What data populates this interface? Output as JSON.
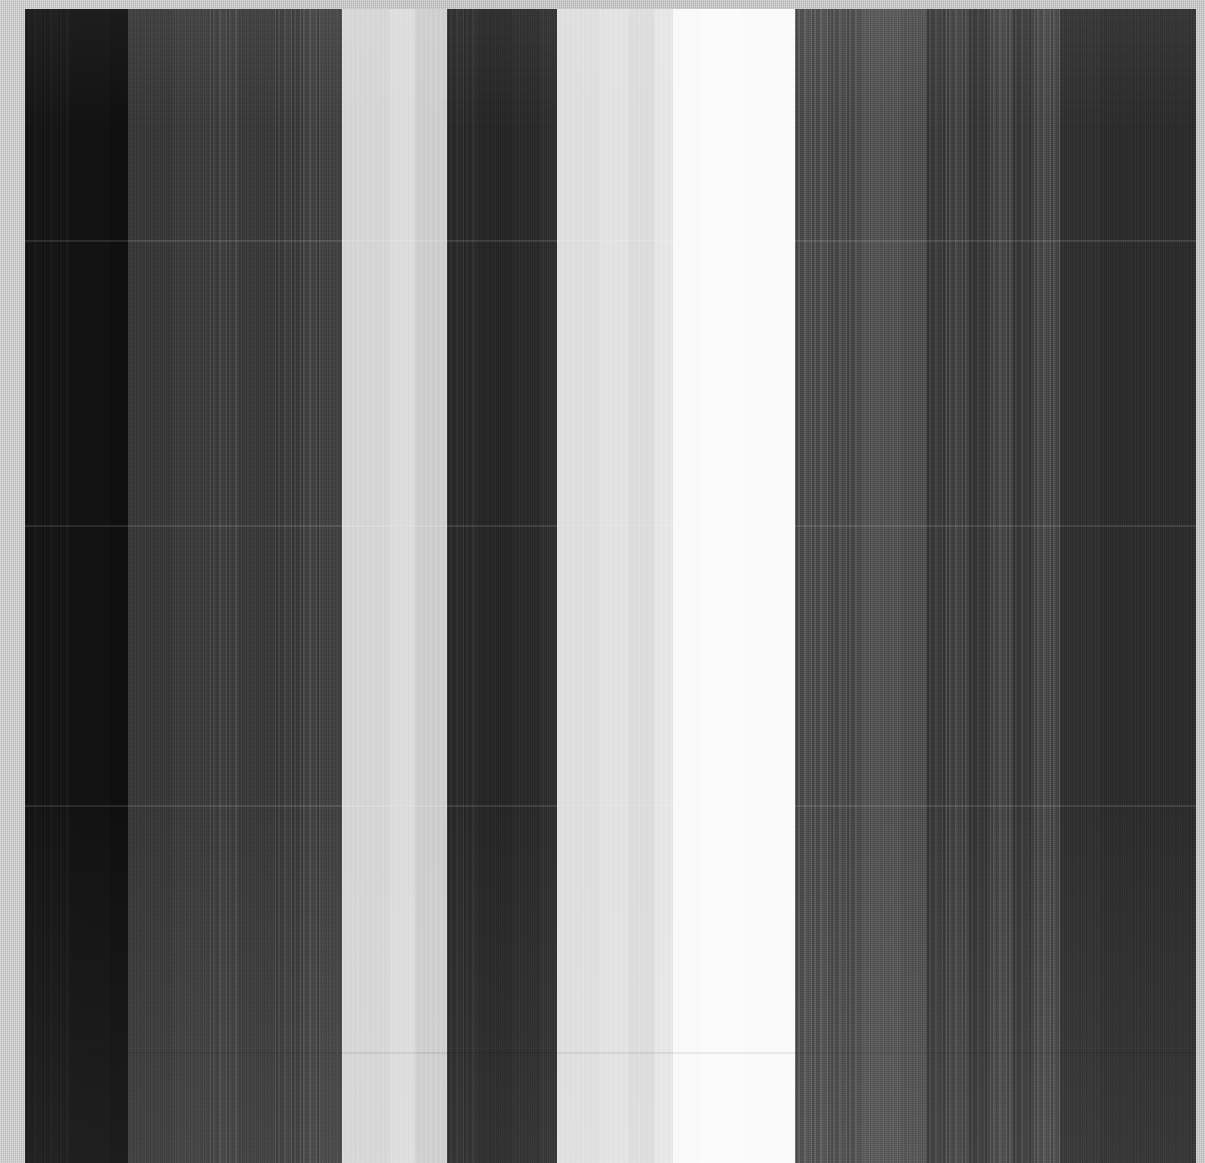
{
  "image": {
    "title": "Grayscale vertical band raster",
    "width": 1205,
    "height": 1163,
    "background_color": "#c9c9c9",
    "margin_color": "#cbcbcb",
    "margin_left_px": 25,
    "margin_top_px": 9,
    "margin_right_px": 9,
    "margin_bottom_px": 0
  },
  "plate": {
    "x": 25,
    "y": 9,
    "width": 1171,
    "height": 1154
  },
  "chart_data": {
    "type": "heatmap",
    "xlabel": "",
    "ylabel": "",
    "grid": false,
    "legend": "none",
    "orientation": "vertical-bands",
    "value_range": [
      0,
      255
    ],
    "colormap": "grayscale",
    "x": [
      25,
      70,
      110,
      128,
      175,
      210,
      238,
      275,
      300,
      320,
      342,
      390,
      415,
      447,
      478,
      512,
      540,
      557,
      600,
      628,
      655,
      673,
      700,
      740,
      795,
      830,
      862,
      900,
      926,
      946,
      968,
      990,
      1012,
      1034,
      1060,
      1100,
      1196
    ],
    "categories": [
      "b01",
      "b02",
      "b03",
      "b04",
      "b05",
      "b06",
      "b07",
      "b08",
      "b09",
      "b10",
      "b11",
      "b12",
      "b13",
      "b14",
      "b15",
      "b16",
      "b17",
      "b18",
      "b19",
      "b20",
      "b21",
      "b22",
      "b23",
      "b24",
      "b25",
      "b26",
      "b27",
      "b28",
      "b29",
      "b30",
      "b31",
      "b32",
      "b33",
      "b34",
      "b35",
      "b36"
    ],
    "values": [
      22,
      17,
      14,
      56,
      60,
      66,
      58,
      63,
      70,
      66,
      215,
      222,
      208,
      44,
      38,
      42,
      46,
      224,
      228,
      222,
      232,
      250,
      252,
      251,
      82,
      78,
      84,
      80,
      62,
      70,
      58,
      74,
      60,
      76,
      48,
      44
    ],
    "bands": [
      {
        "name": "b01",
        "x0": 25,
        "x1": 70,
        "gray": 22,
        "hex": "#161616",
        "stripe": "s2"
      },
      {
        "name": "b02",
        "x0": 70,
        "x1": 110,
        "gray": 17,
        "hex": "#111111",
        "stripe": "s1"
      },
      {
        "name": "b03",
        "x0": 110,
        "x1": 128,
        "gray": 14,
        "hex": "#0e0e0e",
        "stripe": "s1"
      },
      {
        "name": "b04",
        "x0": 128,
        "x1": 175,
        "gray": 56,
        "hex": "#383838",
        "stripe": "s1"
      },
      {
        "name": "b05",
        "x0": 175,
        "x1": 210,
        "gray": 60,
        "hex": "#3c3c3c",
        "stripe": "s1"
      },
      {
        "name": "b06",
        "x0": 210,
        "x1": 238,
        "gray": 66,
        "hex": "#424242",
        "stripe": "s2"
      },
      {
        "name": "b07",
        "x0": 238,
        "x1": 275,
        "gray": 58,
        "hex": "#3a3a3a",
        "stripe": "s1"
      },
      {
        "name": "b08",
        "x0": 275,
        "x1": 300,
        "gray": 63,
        "hex": "#3f3f3f",
        "stripe": "s2"
      },
      {
        "name": "b09",
        "x0": 300,
        "x1": 320,
        "gray": 70,
        "hex": "#464646",
        "stripe": "s2"
      },
      {
        "name": "b10",
        "x0": 320,
        "x1": 342,
        "gray": 66,
        "hex": "#424242",
        "stripe": "s1"
      },
      {
        "name": "b11",
        "x0": 342,
        "x1": 390,
        "gray": 215,
        "hex": "#d7d7d7",
        "stripe": "s3"
      },
      {
        "name": "b12",
        "x0": 390,
        "x1": 415,
        "gray": 222,
        "hex": "#dedede",
        "stripe": "s3"
      },
      {
        "name": "b13",
        "x0": 415,
        "x1": 447,
        "gray": 208,
        "hex": "#d0d0d0",
        "stripe": "s3"
      },
      {
        "name": "b14",
        "x0": 447,
        "x1": 478,
        "gray": 44,
        "hex": "#2c2c2c",
        "stripe": "s2"
      },
      {
        "name": "b15",
        "x0": 478,
        "x1": 512,
        "gray": 38,
        "hex": "#262626",
        "stripe": "s1"
      },
      {
        "name": "b16",
        "x0": 512,
        "x1": 540,
        "gray": 42,
        "hex": "#2a2a2a",
        "stripe": "s1"
      },
      {
        "name": "b17",
        "x0": 540,
        "x1": 557,
        "gray": 46,
        "hex": "#2e2e2e",
        "stripe": "s1"
      },
      {
        "name": "b18",
        "x0": 557,
        "x1": 600,
        "gray": 224,
        "hex": "#e0e0e0",
        "stripe": "s3"
      },
      {
        "name": "b19",
        "x0": 600,
        "x1": 628,
        "gray": 228,
        "hex": "#e4e4e4",
        "stripe": "s3"
      },
      {
        "name": "b20",
        "x0": 628,
        "x1": 655,
        "gray": 222,
        "hex": "#dedede",
        "stripe": "s3"
      },
      {
        "name": "b21",
        "x0": 655,
        "x1": 673,
        "gray": 232,
        "hex": "#e8e8e8",
        "stripe": "s3"
      },
      {
        "name": "b22",
        "x0": 673,
        "x1": 700,
        "gray": 250,
        "hex": "#fafafa",
        "stripe": "s0"
      },
      {
        "name": "b23",
        "x0": 700,
        "x1": 740,
        "gray": 252,
        "hex": "#fcfcfc",
        "stripe": "s0"
      },
      {
        "name": "b24",
        "x0": 740,
        "x1": 795,
        "gray": 251,
        "hex": "#fbfbfb",
        "stripe": "s0"
      },
      {
        "name": "b25",
        "x0": 795,
        "x1": 830,
        "gray": 82,
        "hex": "#525252",
        "stripe": "s2"
      },
      {
        "name": "b26",
        "x0": 830,
        "x1": 862,
        "gray": 78,
        "hex": "#4e4e4e",
        "stripe": "s2"
      },
      {
        "name": "b27",
        "x0": 862,
        "x1": 900,
        "gray": 84,
        "hex": "#545454",
        "stripe": "s1"
      },
      {
        "name": "b28",
        "x0": 900,
        "x1": 926,
        "gray": 80,
        "hex": "#505050",
        "stripe": "s1"
      },
      {
        "name": "b29",
        "x0": 926,
        "x1": 946,
        "gray": 62,
        "hex": "#3e3e3e",
        "stripe": "s2"
      },
      {
        "name": "b30",
        "x0": 946,
        "x1": 968,
        "gray": 70,
        "hex": "#464646",
        "stripe": "s2"
      },
      {
        "name": "b31",
        "x0": 968,
        "x1": 990,
        "gray": 58,
        "hex": "#3a3a3a",
        "stripe": "s2"
      },
      {
        "name": "b32",
        "x0": 990,
        "x1": 1012,
        "gray": 74,
        "hex": "#4a4a4a",
        "stripe": "s2"
      },
      {
        "name": "b33",
        "x0": 1012,
        "x1": 1034,
        "gray": 60,
        "hex": "#3c3c3c",
        "stripe": "s2"
      },
      {
        "name": "b34",
        "x0": 1034,
        "x1": 1060,
        "gray": 76,
        "hex": "#4c4c4c",
        "stripe": "s2"
      },
      {
        "name": "b35",
        "x0": 1060,
        "x1": 1100,
        "gray": 48,
        "hex": "#303030",
        "stripe": "s1"
      },
      {
        "name": "b36",
        "x0": 1100,
        "x1": 1196,
        "gray": 44,
        "hex": "#2c2c2c",
        "stripe": "s1"
      }
    ],
    "horizontal_seams": [
      {
        "y": 240,
        "kind": "light"
      },
      {
        "y": 525,
        "kind": "light"
      },
      {
        "y": 805,
        "kind": "light"
      },
      {
        "y": 1052,
        "kind": "dark"
      }
    ]
  }
}
